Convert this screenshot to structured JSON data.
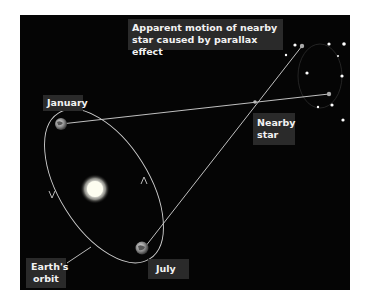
{
  "diagram": {
    "title": "Apparent motion of nearby star caused by parallax effect",
    "labels": {
      "apparent_motion": "Apparent motion of nearby star caused by parallax effect",
      "january": "January",
      "july": "July",
      "nearby_star": "Nearby star",
      "earths_orbit": "Earth's orbit"
    },
    "colors": {
      "background": "#050505",
      "label_box": "#2a2a2a",
      "label_text": "#f2f2f2",
      "lines": "#cfcfcf",
      "sun": "#fdfdf0"
    },
    "elements": {
      "sun": "sun-icon",
      "earth_january": "earth-icon",
      "earth_july": "earth-icon",
      "nearby_star": "star-icon",
      "background_stars": 11
    }
  }
}
